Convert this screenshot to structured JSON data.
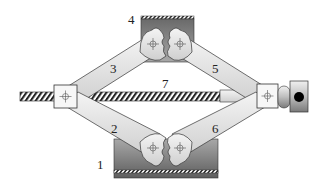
{
  "diagram": {
    "labels": {
      "base": "1",
      "lower_left_arm": "2",
      "upper_left_arm": "3",
      "top_plate": "4",
      "upper_right_arm": "5",
      "lower_right_arm": "6",
      "screw": "7"
    },
    "colors": {
      "arm_light": "#f2f2f2",
      "arm_dark": "#c8c8c8",
      "block_light": "#9a9a9a",
      "block_dark": "#5f5f5f",
      "outline": "#333333",
      "screw_hatch": "#222222",
      "knob_dot": "#000000"
    }
  }
}
